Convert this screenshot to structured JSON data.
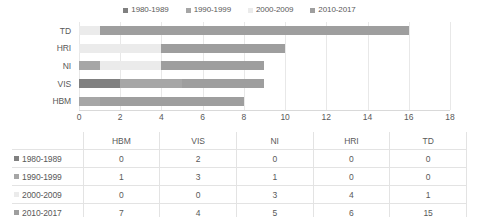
{
  "colors": {
    "s1980": "#808080",
    "s1990": "#a6a6a6",
    "s2000": "#ebebeb",
    "s2010": "#9e9e9e",
    "grid": "#e8e8e8",
    "text": "#595959",
    "table_border": "#e3e3e3"
  },
  "legend": {
    "items": [
      {
        "label": "1980-1989",
        "swatch": "legend-swatch-1980-1989",
        "color": "#808080"
      },
      {
        "label": "1990-1999",
        "swatch": "legend-swatch-1990-1999",
        "color": "#a6a6a6"
      },
      {
        "label": "2000-2009",
        "swatch": "legend-swatch-2000-2009",
        "color": "#ebebeb"
      },
      {
        "label": "2010-2017",
        "swatch": "legend-swatch-2010-2017",
        "color": "#9e9e9e"
      }
    ]
  },
  "chart_data": {
    "type": "bar",
    "orientation": "horizontal",
    "stacked": true,
    "title": "",
    "subtitle": "",
    "xlabel": "",
    "ylabel": "",
    "categories": [
      "TD",
      "HRI",
      "NI",
      "VIS",
      "HBM"
    ],
    "series": [
      {
        "name": "1980-1989",
        "color": "#808080",
        "values": [
          0,
          0,
          0,
          2,
          0
        ]
      },
      {
        "name": "1990-1999",
        "color": "#a6a6a6",
        "values": [
          0,
          0,
          1,
          3,
          1
        ]
      },
      {
        "name": "2000-2009",
        "color": "#ebebeb",
        "values": [
          1,
          4,
          3,
          0,
          0
        ]
      },
      {
        "name": "2010-2017",
        "color": "#9e9e9e",
        "values": [
          15,
          6,
          5,
          4,
          7
        ]
      }
    ],
    "totals": [
      16,
      10,
      9,
      9,
      8
    ],
    "xlim": [
      0,
      18
    ],
    "xticks": [
      0,
      2,
      4,
      6,
      8,
      10,
      12,
      14,
      16,
      18
    ],
    "xtick_labels": [
      "0",
      "2",
      "4",
      "6",
      "8",
      "10",
      "12",
      "14",
      "16",
      "18"
    ],
    "grid": "vertical",
    "legend_position": "top"
  },
  "table": {
    "corner_label": "",
    "columns": [
      "HBM",
      "VIS",
      "NI",
      "HRI",
      "TD"
    ],
    "rows": [
      {
        "label": "1980-1989",
        "color": "#808080",
        "values": [
          "0",
          "2",
          "0",
          "0",
          "0"
        ]
      },
      {
        "label": "1990-1999",
        "color": "#a6a6a6",
        "values": [
          "1",
          "3",
          "1",
          "0",
          "0"
        ]
      },
      {
        "label": "2000-2009",
        "color": "#ebebeb",
        "values": [
          "0",
          "0",
          "3",
          "4",
          "1"
        ]
      },
      {
        "label": "2010-2017",
        "color": "#9e9e9e",
        "values": [
          "7",
          "4",
          "5",
          "6",
          "15"
        ]
      }
    ]
  }
}
